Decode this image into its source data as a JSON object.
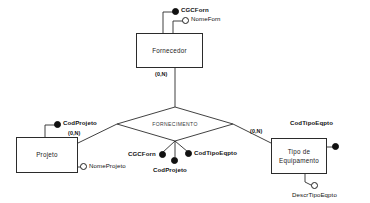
{
  "diagram": {
    "notation": "chen",
    "stroke_color": "#2b2b2b",
    "text_color": "#111111",
    "background_color": "#ffffff",
    "key_marker_color": "#111111"
  },
  "entities": [
    {
      "id": "fornecedor",
      "label": "Fornecedor",
      "x": 136,
      "y": 33,
      "width": 67,
      "height": 35
    },
    {
      "id": "projeto",
      "label": "Projeto",
      "x": 16,
      "y": 137,
      "width": 62,
      "height": 36
    },
    {
      "id": "tipo-de-equipamento",
      "label": "Tipo de\nEquipamento",
      "line1": "Tipo de",
      "line2": "Equipamento",
      "x": 271,
      "y": 138,
      "width": 56,
      "height": 36
    }
  ],
  "relationship": {
    "id": "fornecimento",
    "label": "FORNECIMENTO",
    "center_x": 175,
    "center_y": 124,
    "half_width": 58,
    "half_height": 17
  },
  "attributes": [
    {
      "id": "cgcforn-fornecedor",
      "label": "CGCForn",
      "owner": "fornecedor",
      "key": true,
      "marker": "filled"
    },
    {
      "id": "nomeforn-fornecedor",
      "label": "NomeForn",
      "owner": "fornecedor",
      "key": false,
      "marker": "hollow"
    },
    {
      "id": "codprojeto-projeto",
      "label": "CodProjeto",
      "owner": "projeto",
      "key": true,
      "marker": "filled"
    },
    {
      "id": "nomeprojeto-projeto",
      "label": "NomeProjeto",
      "owner": "projeto",
      "key": false,
      "marker": "hollow"
    },
    {
      "id": "codtipoeqpto-tipo",
      "label": "CodTipoEqpto",
      "owner": "tipo-de-equipamento",
      "key": true,
      "marker": "filled"
    },
    {
      "id": "descrtipoeqpto-tipo",
      "label": "DescrTipoEqpto",
      "owner": "tipo-de-equipamento",
      "key": false,
      "marker": "hollow"
    },
    {
      "id": "cgcforn-rel",
      "label": "CGCForn",
      "owner": "fornecimento",
      "key": true,
      "marker": "filled"
    },
    {
      "id": "codprojeto-rel",
      "label": "CodProjeto",
      "owner": "fornecimento",
      "key": true,
      "marker": "filled"
    },
    {
      "id": "codtipoeqpto-rel",
      "label": "CodTipoEqpto",
      "owner": "fornecimento",
      "key": true,
      "marker": "filled"
    }
  ],
  "cardinalities": [
    {
      "id": "card-fornecedor",
      "value": "(0,N)",
      "near": "fornecedor"
    },
    {
      "id": "card-projeto",
      "value": "(0,N)",
      "near": "projeto"
    },
    {
      "id": "card-tipo",
      "value": "(0,N)",
      "near": "tipo-de-equipamento"
    }
  ]
}
